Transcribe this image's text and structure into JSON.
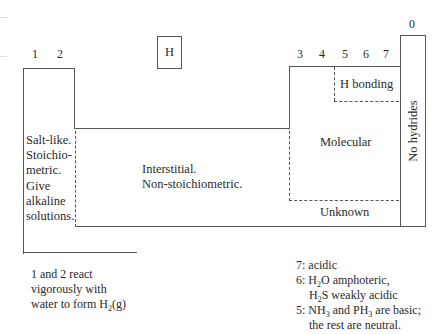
{
  "diagram": {
    "group_labels": {
      "g1": "1",
      "g2": "2",
      "g3": "3",
      "g4": "4",
      "g5": "5",
      "g6": "6",
      "g7": "7",
      "g0": "0"
    },
    "hydrogen_box": "H",
    "regions": {
      "salt_like": [
        "Salt-like.",
        "Stoichio-",
        "metric.",
        "Give",
        "alkaline",
        "solutions."
      ],
      "interstitial": [
        "Interstitial.",
        "Non-stoichiometric."
      ],
      "molecular": "Molecular",
      "h_bonding": "H bonding",
      "unknown": "Unknown",
      "no_hydrides": "No hydrides"
    },
    "notes": {
      "left": {
        "line1": "1 and 2 react",
        "line2": "vigorously with",
        "line3_pre": "water to form H",
        "line3_sub": "2",
        "line3_post": "(g)"
      },
      "right": {
        "l1": "7: acidic",
        "l2_pre": "6: H",
        "l2_sub": "2",
        "l2_post": "O amphoteric,",
        "l3_pre": "H",
        "l3_sub": "2",
        "l3_post": "S weakly acidic",
        "l4_pre": "5: NH",
        "l4_sub1": "3",
        "l4_mid": " and PH",
        "l4_sub2": "3",
        "l4_post": " are basic;",
        "l5": "the rest are neutral."
      }
    },
    "colors": {
      "line": "#555555",
      "text": "#2a2a2a",
      "background": "#ffffff"
    }
  }
}
